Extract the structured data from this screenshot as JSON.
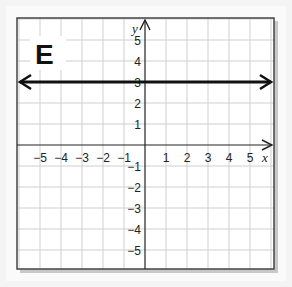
{
  "panel_label": "E",
  "chart_data": {
    "type": "line",
    "title": "E",
    "xlabel": "x",
    "ylabel": "y",
    "xlim": [
      -6,
      6
    ],
    "ylim": [
      -6,
      6
    ],
    "grid": true,
    "x_ticks": [
      "-5",
      "-4",
      "-3",
      "-2",
      "-1",
      "1",
      "2",
      "3",
      "4",
      "5"
    ],
    "y_ticks": [
      "5",
      "4",
      "3",
      "2",
      "1",
      "-1",
      "-2",
      "-3",
      "-4",
      "-5"
    ],
    "series": [
      {
        "name": "y = 3",
        "equation": "y = 3",
        "x": [
          -6,
          6
        ],
        "y": [
          3,
          3
        ],
        "arrows": "both"
      }
    ]
  }
}
